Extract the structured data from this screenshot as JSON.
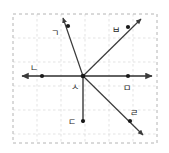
{
  "figure": {
    "background_color": "#ffffff",
    "plot_area": {
      "left": 13,
      "top": 14,
      "right": 157,
      "bottom": 143,
      "border_style": "dashed",
      "border_color": "#b9b9b9",
      "grid": true,
      "grid_color": "#d9d9d9",
      "grid_spacing": 24
    },
    "line_color": "#3a3a3a",
    "point_color": "#1a1a1a",
    "label_color": "#262626"
  },
  "labels": {
    "a": "ㄱ",
    "b": "ㄴ",
    "c": "ㄷ",
    "d": "ㄹ",
    "e": "ㅁ",
    "f": "ㅂ",
    "g": "ㅅ"
  },
  "points": [
    {
      "id": "vertex",
      "label": "ㅅ",
      "x": 83,
      "y": 76,
      "label_x": 72,
      "label_y": 90,
      "dot": true
    },
    {
      "id": "left",
      "label": "ㄴ",
      "x": 42,
      "y": 76,
      "label_x": 34,
      "label_y": 70,
      "dot": true
    },
    {
      "id": "right",
      "label": "ㅁ",
      "x": 128,
      "y": 76,
      "label_x": 123,
      "label_y": 90,
      "dot": true
    },
    {
      "id": "down",
      "label": "ㄷ",
      "x": 83,
      "y": 121,
      "label_x": 70,
      "label_y": 126,
      "dot": true
    },
    {
      "id": "upleft",
      "label": "ㄱ",
      "x": 68,
      "y": 26,
      "label_x": 55,
      "label_y": 36,
      "dot": true
    },
    {
      "id": "upright",
      "label": "ㅂ",
      "x": 128,
      "y": 27,
      "label_x": 114,
      "label_y": 34,
      "dot": true
    },
    {
      "id": "downright",
      "label": "ㄹ",
      "x": 130,
      "y": 121,
      "label_x": 131,
      "label_y": 117,
      "dot": true
    }
  ],
  "rays": [
    {
      "id": "horizontal-axis",
      "from": [
        22,
        76
      ],
      "to": [
        152,
        76
      ],
      "arrow": "both"
    },
    {
      "id": "ray-upleft",
      "from": [
        83,
        76
      ],
      "to": [
        63,
        18
      ],
      "arrow": "end"
    },
    {
      "id": "ray-upright",
      "from": [
        83,
        76
      ],
      "to": [
        141,
        19
      ],
      "arrow": "end"
    },
    {
      "id": "ray-downright",
      "from": [
        83,
        76
      ],
      "to": [
        143,
        135
      ],
      "arrow": "end"
    },
    {
      "id": "segment-down",
      "from": [
        83,
        76
      ],
      "to": [
        83,
        123
      ],
      "arrow": "none"
    }
  ]
}
